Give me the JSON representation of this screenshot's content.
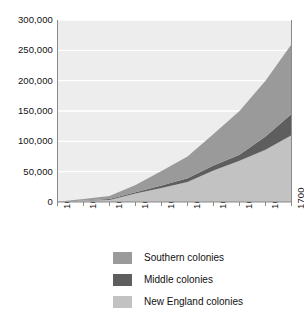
{
  "chart_data": {
    "type": "area",
    "stacked": true,
    "title": "",
    "subtitle": "",
    "xlabel": "",
    "ylabel": "",
    "x": [
      1610,
      1620,
      1630,
      1640,
      1650,
      1660,
      1670,
      1680,
      1690,
      1700
    ],
    "categories": [
      "1610",
      "1620",
      "1630",
      "1640",
      "1650",
      "1660",
      "1670",
      "1680",
      "1690",
      "1700"
    ],
    "xlim": [
      1610,
      1700
    ],
    "ylim": [
      0,
      300000
    ],
    "yticks": [
      0,
      50000,
      100000,
      150000,
      200000,
      250000,
      300000
    ],
    "ytick_labels": [
      "0",
      "50,000",
      "100,000",
      "150,000",
      "200,000",
      "250,000",
      "300,000"
    ],
    "grid": true,
    "grid_color": "#ffffff",
    "plot_background": "#ededed",
    "legend_position": "bottom",
    "series": [
      {
        "name": "New England colonies",
        "color": "#c2c2c2",
        "order": 1,
        "values": [
          0,
          2000,
          3500,
          14000,
          23000,
          33000,
          52000,
          68000,
          86000,
          110000
        ]
      },
      {
        "name": "Middle colonies",
        "color": "#5e5e5e",
        "order": 2,
        "values": [
          0,
          500,
          1500,
          2000,
          4000,
          6000,
          8000,
          10000,
          22000,
          35000
        ]
      },
      {
        "name": "Southern colonies",
        "color": "#9a9a9a",
        "order": 3,
        "values": [
          350,
          2500,
          5000,
          12000,
          24000,
          36000,
          52000,
          72000,
          92000,
          115000
        ]
      }
    ],
    "cumulative_totals": [
      350,
      5000,
      10000,
      28000,
      51000,
      75000,
      112000,
      150000,
      200000,
      260000
    ]
  },
  "axis": {
    "y_tick_labels": [
      "300,000",
      "250,000",
      "200,000",
      "150,000",
      "100,000",
      "50,000",
      "0"
    ],
    "x_tick_labels": [
      "1610",
      "1620",
      "1630",
      "1640",
      "1650",
      "1660",
      "1670",
      "1680",
      "1690",
      "1700"
    ]
  },
  "legend": {
    "items": [
      {
        "label": "Southern colonies",
        "color": "#9a9a9a"
      },
      {
        "label": "Middle colonies",
        "color": "#5e5e5e"
      },
      {
        "label": "New England colonies",
        "color": "#c2c2c2"
      }
    ]
  }
}
